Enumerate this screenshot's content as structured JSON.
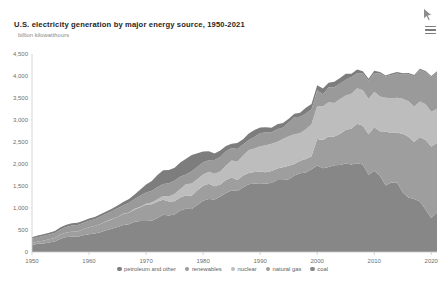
{
  "header": {
    "title": "U.S. electricity generation by major energy source, 1950-2021",
    "subtitle": "billion kilowatthours",
    "menu_icon": "hamburger-menu-icon",
    "cursor_icon": "mouse-cursor-icon"
  },
  "chart_data": {
    "type": "area",
    "stacked": true,
    "title": "U.S. electricity generation by major energy source, 1950-2021",
    "subtitle": "billion kilowatthours",
    "xlabel": "",
    "ylabel": "billion kilowatthours",
    "xlim": [
      1950,
      2021
    ],
    "ylim": [
      0,
      4500
    ],
    "grid": false,
    "legend_position": "bottom",
    "y_ticks": [
      "0",
      "500",
      "1,000",
      "1,500",
      "2,000",
      "2,500",
      "3,000",
      "3,500",
      "4,000",
      "4,500"
    ],
    "y_tick_values": [
      0,
      500,
      1000,
      1500,
      2000,
      2500,
      3000,
      3500,
      4000,
      4500
    ],
    "x_ticks": [
      "1950",
      "1960",
      "1970",
      "1980",
      "1990",
      "2000",
      "2010",
      "2020"
    ],
    "x_tick_values": [
      1950,
      1960,
      1970,
      1980,
      1990,
      2000,
      2010,
      2020
    ],
    "x": [
      1950,
      1951,
      1952,
      1953,
      1954,
      1955,
      1956,
      1957,
      1958,
      1959,
      1960,
      1961,
      1962,
      1963,
      1964,
      1965,
      1966,
      1967,
      1968,
      1969,
      1970,
      1971,
      1972,
      1973,
      1974,
      1975,
      1976,
      1977,
      1978,
      1979,
      1980,
      1981,
      1982,
      1983,
      1984,
      1985,
      1986,
      1987,
      1988,
      1989,
      1990,
      1991,
      1992,
      1993,
      1994,
      1995,
      1996,
      1997,
      1998,
      1999,
      2000,
      2001,
      2002,
      2003,
      2004,
      2005,
      2006,
      2007,
      2008,
      2009,
      2010,
      2011,
      2012,
      2013,
      2014,
      2015,
      2016,
      2017,
      2018,
      2019,
      2020,
      2021
    ],
    "series": [
      {
        "name": "coal",
        "color": "#878787",
        "values": [
          155,
          185,
          195,
          218,
          239,
          301,
          339,
          346,
          344,
          382,
          403,
          422,
          450,
          494,
          526,
          571,
          613,
          630,
          685,
          706,
          704,
          713,
          771,
          848,
          828,
          853,
          944,
          985,
          976,
          1075,
          1162,
          1203,
          1192,
          1259,
          1342,
          1402,
          1386,
          1464,
          1541,
          1554,
          1560,
          1551,
          1576,
          1639,
          1635,
          1653,
          1737,
          1788,
          1807,
          1881,
          1966,
          1904,
          1933,
          1974,
          1978,
          2013,
          1991,
          2016,
          1986,
          1756,
          1847,
          1733,
          1514,
          1581,
          1582,
          1352,
          1239,
          1206,
          1146,
          966,
          774,
          898
        ]
      },
      {
        "name": "natural gas",
        "color": "#9e9e9e",
        "values": [
          45,
          52,
          62,
          72,
          82,
          95,
          106,
          114,
          120,
          136,
          158,
          169,
          184,
          202,
          220,
          222,
          248,
          261,
          283,
          311,
          373,
          374,
          376,
          341,
          320,
          300,
          295,
          306,
          305,
          329,
          346,
          346,
          305,
          274,
          297,
          292,
          249,
          273,
          253,
          267,
          264,
          264,
          264,
          259,
          291,
          307,
          263,
          284,
          309,
          297,
          601,
          639,
          691,
          650,
          710,
          761,
          816,
          897,
          883,
          921,
          988,
          1013,
          1225,
          1125,
          1126,
          1333,
          1379,
          1296,
          1468,
          1582,
          1624,
          1579
        ]
      },
      {
        "name": "nuclear",
        "color": "#bdbdbd",
        "values": [
          0,
          0,
          0,
          0,
          0,
          0,
          0,
          0,
          0,
          0,
          1,
          2,
          2,
          3,
          3,
          4,
          6,
          8,
          13,
          14,
          22,
          38,
          54,
          83,
          114,
          173,
          191,
          251,
          276,
          255,
          251,
          273,
          283,
          294,
          328,
          384,
          414,
          455,
          527,
          529,
          577,
          613,
          619,
          610,
          640,
          673,
          675,
          629,
          674,
          728,
          754,
          769,
          780,
          764,
          789,
          782,
          787,
          806,
          806,
          799,
          807,
          790,
          769,
          789,
          797,
          797,
          806,
          805,
          807,
          809,
          790,
          778
        ]
      },
      {
        "name": "renewables",
        "color": "#9a9a9a",
        "values": [
          101,
          101,
          106,
          106,
          109,
          116,
          125,
          140,
          147,
          140,
          149,
          153,
          173,
          169,
          178,
          197,
          195,
          222,
          222,
          253,
          251,
          266,
          274,
          272,
          301,
          300,
          284,
          220,
          280,
          280,
          279,
          261,
          309,
          333,
          321,
          284,
          293,
          250,
          223,
          266,
          301,
          288,
          260,
          280,
          261,
          311,
          385,
          373,
          355,
          334,
          356,
          276,
          341,
          359,
          351,
          358,
          385,
          352,
          382,
          417,
          428,
          520,
          478,
          528,
          549,
          548,
          613,
          687,
          713,
          728,
          792,
          826
        ]
      },
      {
        "name": "petroleum and other",
        "color": "#7d7d7d",
        "values": [
          34,
          38,
          42,
          44,
          46,
          50,
          52,
          52,
          53,
          54,
          48,
          49,
          49,
          50,
          55,
          65,
          74,
          84,
          104,
          137,
          184,
          220,
          274,
          314,
          301,
          289,
          320,
          358,
          365,
          304,
          246,
          206,
          147,
          144,
          120,
          100,
          137,
          118,
          149,
          158,
          126,
          119,
          103,
          115,
          105,
          82,
          83,
          93,
          131,
          124,
          112,
          130,
          100,
          124,
          126,
          135,
          73,
          74,
          52,
          45,
          47,
          36,
          27,
          32,
          35,
          33,
          31,
          29,
          32,
          26,
          21,
          26
        ]
      }
    ]
  },
  "legend": {
    "items": [
      {
        "label": "petroleum and other",
        "color": "#7d7d7d"
      },
      {
        "label": "renewables",
        "color": "#9a9a9a"
      },
      {
        "label": "nuclear",
        "color": "#bdbdbd"
      },
      {
        "label": "natural gas",
        "color": "#9e9e9e"
      },
      {
        "label": "coal",
        "color": "#878787"
      }
    ]
  }
}
